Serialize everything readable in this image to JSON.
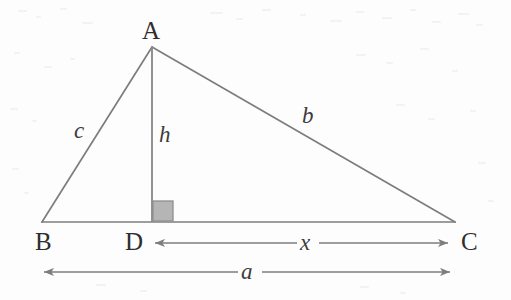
{
  "figure": {
    "kind": "geometry-diagram",
    "background_color": "#fdfdfd",
    "stroke_color": "#7d7d7d",
    "label_color": "#2e2e2e",
    "right_angle_fill": "#b4b4b4",
    "right_angle_stroke": "#8a8a8a"
  },
  "vertices": {
    "A": {
      "label": "A",
      "x": 152,
      "y": 47
    },
    "B": {
      "label": "B",
      "x": 42,
      "y": 222
    },
    "C": {
      "label": "C",
      "x": 455,
      "y": 222
    },
    "D": {
      "label": "D",
      "x": 152,
      "y": 222
    }
  },
  "segments": {
    "c": {
      "label": "c",
      "from": "B",
      "to": "A"
    },
    "b": {
      "label": "b",
      "from": "A",
      "to": "C"
    },
    "h": {
      "label": "h",
      "from": "A",
      "to": "D"
    },
    "base": {
      "from": "B",
      "to": "C"
    }
  },
  "measures": {
    "x": {
      "label": "x",
      "from": "D",
      "to": "C",
      "arrow": "double"
    },
    "a": {
      "label": "a",
      "from": "B",
      "to": "C",
      "arrow": "double"
    }
  },
  "marks": {
    "right_angle": {
      "name": "right-angle-mark",
      "at": "D",
      "size": 20
    }
  }
}
